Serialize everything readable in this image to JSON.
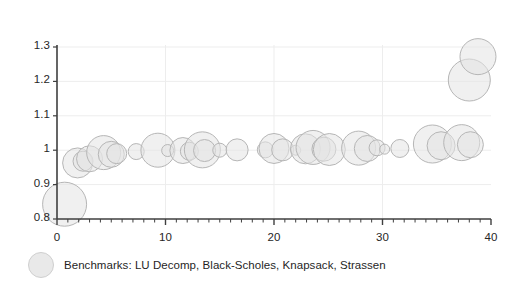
{
  "chart_data": {
    "type": "scatter",
    "title": "",
    "xlabel": "",
    "ylabel": "",
    "xlim": [
      0,
      40
    ],
    "ylim": [
      0.8,
      1.3
    ],
    "grid": true,
    "grid_x_values": [
      10,
      20,
      30
    ],
    "grid_y_values": [
      0.9,
      1.0,
      1.1,
      1.2,
      1.3
    ],
    "x_ticks": [
      0,
      10,
      20,
      30,
      40
    ],
    "x_tick_labels": [
      "0",
      "10",
      "20",
      "30",
      "40"
    ],
    "x_minor_tick_step": 1,
    "y_ticks": [
      0.8,
      0.9,
      1.0,
      1.1,
      1.2,
      1.3
    ],
    "y_tick_labels": [
      "0.8",
      "0.9",
      "1",
      "1.1",
      "1.2",
      "1.3"
    ],
    "legend_position": "below-left",
    "legend": [
      {
        "label": "Benchmarks: LU Decomp, Black-Scholes, Knapsack, Strassen",
        "marker": "bubble"
      }
    ],
    "series": [
      {
        "name": "Benchmarks: LU Decomp, Black-Scholes, Knapsack, Strassen",
        "marker": "bubble",
        "points": [
          {
            "x": 0.7,
            "y": 0.843,
            "r": 22
          },
          {
            "x": 1.9,
            "y": 0.963,
            "r": 15
          },
          {
            "x": 2.4,
            "y": 0.968,
            "r": 10
          },
          {
            "x": 3.0,
            "y": 0.975,
            "r": 13
          },
          {
            "x": 4.3,
            "y": 0.993,
            "r": 17
          },
          {
            "x": 5.0,
            "y": 0.988,
            "r": 13
          },
          {
            "x": 5.5,
            "y": 0.99,
            "r": 10
          },
          {
            "x": 7.3,
            "y": 0.996,
            "r": 8
          },
          {
            "x": 9.3,
            "y": 1.0,
            "r": 17
          },
          {
            "x": 10.2,
            "y": 0.999,
            "r": 6
          },
          {
            "x": 11.6,
            "y": 0.999,
            "r": 13
          },
          {
            "x": 12.2,
            "y": 0.997,
            "r": 9
          },
          {
            "x": 13.4,
            "y": 1.001,
            "r": 18
          },
          {
            "x": 13.6,
            "y": 0.999,
            "r": 11
          },
          {
            "x": 15.0,
            "y": 1.0,
            "r": 7
          },
          {
            "x": 16.6,
            "y": 1.001,
            "r": 11
          },
          {
            "x": 19.2,
            "y": 1.001,
            "r": 8
          },
          {
            "x": 20.0,
            "y": 1.005,
            "r": 15
          },
          {
            "x": 20.8,
            "y": 1.001,
            "r": 11
          },
          {
            "x": 22.0,
            "y": 1.0,
            "r": 5
          },
          {
            "x": 22.9,
            "y": 1.004,
            "r": 15
          },
          {
            "x": 23.6,
            "y": 1.008,
            "r": 17
          },
          {
            "x": 24.6,
            "y": 1.003,
            "r": 12
          },
          {
            "x": 25.1,
            "y": 1.002,
            "r": 16
          },
          {
            "x": 27.8,
            "y": 1.006,
            "r": 17
          },
          {
            "x": 28.6,
            "y": 1.005,
            "r": 13
          },
          {
            "x": 29.5,
            "y": 1.007,
            "r": 8
          },
          {
            "x": 30.2,
            "y": 1.003,
            "r": 5
          },
          {
            "x": 31.6,
            "y": 1.005,
            "r": 9
          },
          {
            "x": 34.6,
            "y": 1.018,
            "r": 19
          },
          {
            "x": 35.4,
            "y": 1.013,
            "r": 14
          },
          {
            "x": 37.3,
            "y": 1.022,
            "r": 18
          },
          {
            "x": 38.1,
            "y": 1.016,
            "r": 13
          },
          {
            "x": 38.0,
            "y": 1.204,
            "r": 21
          },
          {
            "x": 38.8,
            "y": 1.272,
            "r": 18
          }
        ]
      }
    ]
  },
  "style": {
    "bubble_fill": "#e4e4e4",
    "bubble_stroke": "#b6b6b6",
    "axis_color": "#3f3f3f",
    "grid_color": "#ededed",
    "text_color": "#262626"
  }
}
